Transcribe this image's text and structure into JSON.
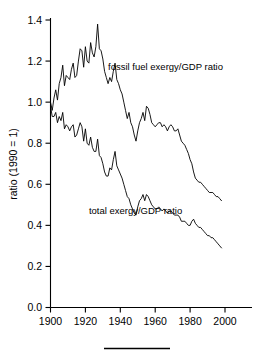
{
  "chart_data": {
    "type": "line",
    "title": "",
    "xlabel": "",
    "ylabel": "ratio (1990 = 1)",
    "xlim": [
      1900,
      2000
    ],
    "ylim": [
      0.0,
      1.4
    ],
    "grid": false,
    "legend_position": "inline-annotations",
    "xticks": [
      1900,
      1920,
      1940,
      1960,
      1980,
      2000
    ],
    "xticklabels": [
      "1900",
      "1920",
      "1940",
      "1960",
      "1980",
      "2000"
    ],
    "yticks": [
      0.0,
      0.2,
      0.4,
      0.6,
      0.8,
      1.0,
      1.2,
      1.4
    ],
    "yticklabels": [
      "0.0",
      "0.2",
      "0.4",
      "0.6",
      "0.8",
      "1.0",
      "1.2",
      "1.4"
    ],
    "annotations": [
      {
        "text": "fossil fuel exergy/GDP ratio",
        "x": 1933,
        "y": 1.155
      },
      {
        "text": "total exergy/GDP ratio",
        "x": 1922,
        "y": 0.455
      }
    ],
    "series": [
      {
        "name": "fossil fuel exergy/GDP ratio",
        "color": "#000000",
        "x": [
          1900,
          1901,
          1902,
          1903,
          1904,
          1905,
          1906,
          1907,
          1908,
          1909,
          1910,
          1911,
          1912,
          1913,
          1914,
          1915,
          1916,
          1917,
          1918,
          1919,
          1920,
          1921,
          1922,
          1923,
          1924,
          1925,
          1926,
          1927,
          1928,
          1929,
          1930,
          1931,
          1932,
          1933,
          1934,
          1935,
          1936,
          1937,
          1938,
          1939,
          1940,
          1941,
          1942,
          1943,
          1944,
          1945,
          1946,
          1947,
          1948,
          1949,
          1950,
          1951,
          1952,
          1953,
          1954,
          1955,
          1956,
          1957,
          1958,
          1959,
          1960,
          1961,
          1962,
          1963,
          1964,
          1965,
          1966,
          1967,
          1968,
          1969,
          1970,
          1971,
          1972,
          1973,
          1974,
          1975,
          1976,
          1977,
          1978,
          1979,
          1980,
          1981,
          1982,
          1983,
          1984,
          1985,
          1986,
          1987,
          1988,
          1989,
          1990,
          1991,
          1992,
          1993,
          1994,
          1995,
          1996,
          1997,
          1998
        ],
        "y": [
          1.0,
          0.96,
          1.02,
          1.06,
          1.01,
          1.09,
          1.12,
          1.18,
          1.08,
          1.13,
          1.12,
          1.11,
          1.16,
          1.19,
          1.12,
          1.13,
          1.2,
          1.26,
          1.25,
          1.17,
          1.27,
          1.2,
          1.19,
          1.29,
          1.24,
          1.22,
          1.27,
          1.38,
          1.26,
          1.25,
          1.21,
          1.15,
          1.12,
          1.09,
          1.12,
          1.1,
          1.15,
          1.19,
          1.11,
          1.09,
          1.06,
          1.04,
          1.0,
          0.96,
          0.92,
          0.95,
          0.9,
          0.88,
          0.84,
          0.81,
          0.86,
          0.9,
          0.92,
          0.95,
          0.91,
          0.98,
          0.97,
          0.94,
          0.9,
          0.89,
          0.88,
          0.89,
          0.9,
          0.9,
          0.88,
          0.89,
          0.88,
          0.86,
          0.88,
          0.89,
          0.88,
          0.86,
          0.86,
          0.87,
          0.84,
          0.81,
          0.8,
          0.79,
          0.77,
          0.75,
          0.72,
          0.7,
          0.66,
          0.63,
          0.62,
          0.61,
          0.61,
          0.6,
          0.59,
          0.58,
          0.57,
          0.56,
          0.56,
          0.56,
          0.55,
          0.54,
          0.54,
          0.53,
          0.52
        ]
      },
      {
        "name": "total exergy/GDP ratio",
        "color": "#000000",
        "x": [
          1900,
          1901,
          1902,
          1903,
          1904,
          1905,
          1906,
          1907,
          1908,
          1909,
          1910,
          1911,
          1912,
          1913,
          1914,
          1915,
          1916,
          1917,
          1918,
          1919,
          1920,
          1921,
          1922,
          1923,
          1924,
          1925,
          1926,
          1927,
          1928,
          1929,
          1930,
          1931,
          1932,
          1933,
          1934,
          1935,
          1936,
          1937,
          1938,
          1939,
          1940,
          1941,
          1942,
          1943,
          1944,
          1945,
          1946,
          1947,
          1948,
          1949,
          1950,
          1951,
          1952,
          1953,
          1954,
          1955,
          1956,
          1957,
          1958,
          1959,
          1960,
          1961,
          1962,
          1963,
          1964,
          1965,
          1966,
          1967,
          1968,
          1969,
          1970,
          1971,
          1972,
          1973,
          1974,
          1975,
          1976,
          1977,
          1978,
          1979,
          1980,
          1981,
          1982,
          1983,
          1984,
          1985,
          1986,
          1987,
          1988,
          1989,
          1990,
          1991,
          1992,
          1993,
          1994,
          1995,
          1996,
          1997,
          1998
        ],
        "y": [
          0.98,
          0.93,
          0.93,
          0.95,
          0.9,
          0.93,
          0.91,
          0.95,
          0.87,
          0.89,
          0.88,
          0.86,
          0.88,
          0.89,
          0.83,
          0.84,
          0.87,
          0.9,
          0.88,
          0.81,
          0.87,
          0.8,
          0.79,
          0.83,
          0.78,
          0.76,
          0.76,
          0.82,
          0.74,
          0.73,
          0.7,
          0.66,
          0.64,
          0.64,
          0.68,
          0.67,
          0.72,
          0.76,
          0.69,
          0.67,
          0.65,
          0.63,
          0.6,
          0.57,
          0.54,
          0.53,
          0.5,
          0.48,
          0.46,
          0.45,
          0.49,
          0.52,
          0.53,
          0.55,
          0.52,
          0.55,
          0.54,
          0.52,
          0.5,
          0.49,
          0.48,
          0.48,
          0.49,
          0.48,
          0.47,
          0.48,
          0.47,
          0.46,
          0.47,
          0.47,
          0.46,
          0.45,
          0.45,
          0.45,
          0.44,
          0.42,
          0.42,
          0.42,
          0.41,
          0.4,
          0.4,
          0.42,
          0.43,
          0.41,
          0.4,
          0.39,
          0.39,
          0.38,
          0.37,
          0.36,
          0.35,
          0.35,
          0.34,
          0.34,
          0.33,
          0.32,
          0.31,
          0.3,
          0.29
        ]
      }
    ]
  },
  "figure": {
    "footer_rule": true
  }
}
